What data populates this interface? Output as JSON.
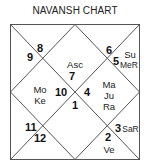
{
  "title": "NAVANSH CHART",
  "chart_style": "North Indian diamond",
  "line_color": "#555555",
  "houses": [
    {
      "position": "top-center",
      "sign": "7",
      "planets": [
        "Asc"
      ]
    },
    {
      "position": "top-left",
      "sign": "8",
      "planets": []
    },
    {
      "position": "left-top",
      "sign": "9",
      "planets": []
    },
    {
      "position": "left-center",
      "sign": "10",
      "planets": [
        "Mo",
        "Ke"
      ]
    },
    {
      "position": "left-bottom",
      "sign": "11",
      "planets": []
    },
    {
      "position": "bottom-left",
      "sign": "12",
      "planets": []
    },
    {
      "position": "bottom-center",
      "sign": "1",
      "planets": []
    },
    {
      "position": "bottom-right",
      "sign": "2",
      "planets": [
        "Ve"
      ]
    },
    {
      "position": "right-bottom",
      "sign": "3",
      "planets": [
        "SaR"
      ]
    },
    {
      "position": "right-center",
      "sign": "4",
      "planets": [
        "Ma",
        "Ju",
        "Ra"
      ]
    },
    {
      "position": "right-top",
      "sign": "5",
      "planets": [
        "Su",
        "MeR"
      ]
    },
    {
      "position": "top-right",
      "sign": "6",
      "planets": []
    }
  ]
}
